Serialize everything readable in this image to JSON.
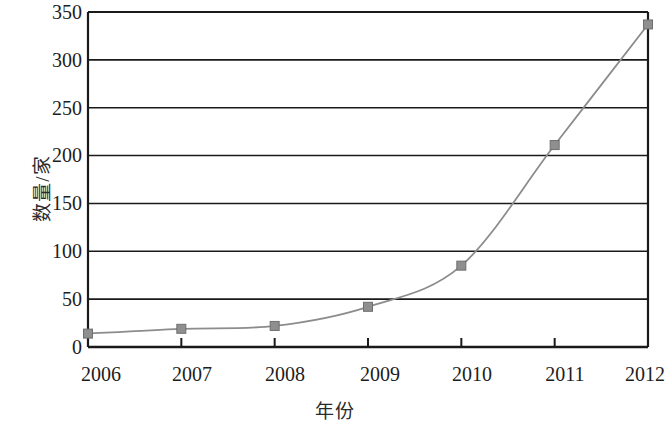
{
  "chart_data": {
    "type": "line",
    "title": "",
    "subtitle": "",
    "xlabel": "年份",
    "ylabel": "数量/家",
    "categories": [
      "2006",
      "2007",
      "2008",
      "2009",
      "2010",
      "2011",
      "2012"
    ],
    "x": [
      2006,
      2007,
      2008,
      2009,
      2010,
      2011,
      2012
    ],
    "values": [
      14,
      19,
      22,
      42,
      85,
      211,
      337
    ],
    "series": [
      {
        "name": "数量/家",
        "values": [
          14,
          19,
          22,
          42,
          85,
          211,
          337
        ]
      }
    ],
    "ylim": [
      0,
      350
    ],
    "xlim": [
      2006,
      2012
    ],
    "ytick_labels": [
      "0",
      "50",
      "100",
      "150",
      "200",
      "250",
      "300",
      "350"
    ],
    "ytick_values": [
      0,
      50,
      100,
      150,
      200,
      250,
      300,
      350
    ],
    "xtick_labels": [
      "2006",
      "2007",
      "2008",
      "2009",
      "2010",
      "2011",
      "2012"
    ],
    "grid": "horizontal",
    "legend": "none",
    "marker": "square",
    "line_color": "#8c8c8c",
    "marker_color": "#8f8f8f",
    "marker_edge_color": "#6f6f6f",
    "axis_color": "#1a1a1a",
    "grid_color": "#1a1a1a",
    "background_color": "#ffffff"
  },
  "axes": {
    "y_label_text": "数量/家",
    "x_label_text": "年份"
  }
}
